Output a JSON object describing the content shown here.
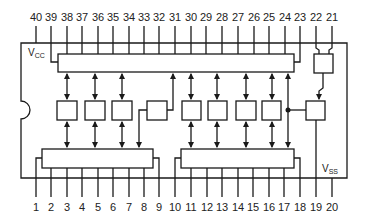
{
  "diagram": {
    "colors": {
      "line": "#1a1a1a",
      "background": "#ffffff"
    },
    "supply": {
      "vcc": {
        "main": "V",
        "sub": "CC"
      },
      "vss": {
        "main": "V",
        "sub": "SS"
      }
    },
    "top_pins": [
      {
        "label": "40",
        "x": 36
      },
      {
        "label": "39",
        "x": 51
      },
      {
        "label": "38",
        "x": 67
      },
      {
        "label": "37",
        "x": 82
      },
      {
        "label": "36",
        "x": 98
      },
      {
        "label": "35",
        "x": 113
      },
      {
        "label": "34",
        "x": 129
      },
      {
        "label": "33",
        "x": 144
      },
      {
        "label": "32",
        "x": 159
      },
      {
        "label": "31",
        "x": 175
      },
      {
        "label": "30",
        "x": 191
      },
      {
        "label": "29",
        "x": 206
      },
      {
        "label": "28",
        "x": 222
      },
      {
        "label": "27",
        "x": 238
      },
      {
        "label": "26",
        "x": 254
      },
      {
        "label": "25",
        "x": 269
      },
      {
        "label": "24",
        "x": 285
      },
      {
        "label": "23",
        "x": 300
      },
      {
        "label": "22",
        "x": 316
      },
      {
        "label": "21",
        "x": 332
      }
    ],
    "bottom_pins": [
      {
        "label": "1",
        "x": 36
      },
      {
        "label": "2",
        "x": 51
      },
      {
        "label": "3",
        "x": 67
      },
      {
        "label": "4",
        "x": 82
      },
      {
        "label": "5",
        "x": 98
      },
      {
        "label": "6",
        "x": 113
      },
      {
        "label": "7",
        "x": 129
      },
      {
        "label": "8",
        "x": 144
      },
      {
        "label": "9",
        "x": 159
      },
      {
        "label": "10",
        "x": 175
      },
      {
        "label": "11",
        "x": 191
      },
      {
        "label": "12",
        "x": 207
      },
      {
        "label": "13",
        "x": 222
      },
      {
        "label": "14",
        "x": 238
      },
      {
        "label": "15",
        "x": 253
      },
      {
        "label": "16",
        "x": 269
      },
      {
        "label": "17",
        "x": 284
      },
      {
        "label": "18",
        "x": 300
      },
      {
        "label": "19",
        "x": 316
      },
      {
        "label": "20",
        "x": 332
      }
    ],
    "blocks": {
      "top_register": {
        "x": 58,
        "y": 54,
        "w": 236,
        "h": 18
      },
      "bottom_left_register": {
        "x": 42,
        "y": 149,
        "w": 111,
        "h": 19
      },
      "bottom_right_register": {
        "x": 181,
        "y": 149,
        "w": 113,
        "h": 19
      },
      "io_buffers": [
        {
          "x": 57,
          "y": 101,
          "w": 20,
          "h": 19
        },
        {
          "x": 85,
          "y": 101,
          "w": 20,
          "h": 19
        },
        {
          "x": 112,
          "y": 101,
          "w": 20,
          "h": 19
        },
        {
          "x": 182,
          "y": 101,
          "w": 19,
          "h": 19
        },
        {
          "x": 208,
          "y": 101,
          "w": 19,
          "h": 19
        },
        {
          "x": 236,
          "y": 101,
          "w": 20,
          "h": 19
        },
        {
          "x": 262,
          "y": 101,
          "w": 19,
          "h": 19
        }
      ],
      "control_block": {
        "x": 147,
        "y": 101,
        "w": 20,
        "h": 19
      },
      "pin22_21_block": {
        "x": 314,
        "y": 54,
        "w": 19,
        "h": 19
      },
      "pin19_block": {
        "x": 306,
        "y": 101,
        "w": 19,
        "h": 19
      }
    }
  }
}
